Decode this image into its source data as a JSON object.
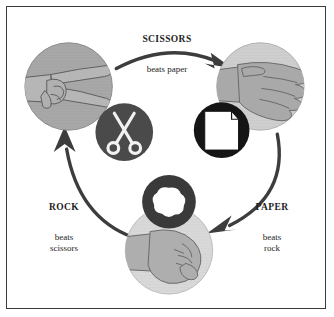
{
  "diagram": {
    "labels": {
      "scissors": {
        "title": "SCISSORS",
        "sub": "beats paper"
      },
      "rock": {
        "title": "ROCK",
        "sub": "beats\nscissors"
      },
      "paper": {
        "title": "PAPER",
        "sub": "beats\nrock"
      }
    },
    "nodes": [
      {
        "id": "scissors-hand",
        "name": "scissors-hand-circle",
        "gesture": "two fingers extended sideways",
        "fill": "#a8a8a8"
      },
      {
        "id": "paper-hand",
        "name": "paper-hand-circle",
        "gesture": "flat open hand",
        "fill": "#cfcfcf"
      },
      {
        "id": "rock-hand",
        "name": "rock-hand-circle",
        "gesture": "closed fist",
        "fill": "#d9d9d9"
      }
    ],
    "icons": [
      {
        "id": "scissors-icon",
        "name": "scissors-icon",
        "circle_fill": "#4a4a4a",
        "glyph_fill": "#f2f2f2"
      },
      {
        "id": "paper-icon",
        "name": "paper-sheet-icon",
        "circle_fill": "#151515",
        "glyph_fill": "#ffffff"
      },
      {
        "id": "rock-icon",
        "name": "rock-ring-icon",
        "ring_fill": "#3a3a3a",
        "center_fill": "#ffffff"
      }
    ],
    "arrows": [
      {
        "id": "arrow-scissors-to-paper",
        "name": "arrow-scissors-to-paper",
        "from": "scissors",
        "to": "paper"
      },
      {
        "id": "arrow-paper-to-rock",
        "name": "arrow-paper-to-rock",
        "from": "paper",
        "to": "rock"
      },
      {
        "id": "arrow-rock-to-scissors",
        "name": "arrow-rock-to-scissors",
        "from": "rock",
        "to": "scissors"
      }
    ],
    "colors": {
      "border": "#3a3a3a",
      "background": "#ffffff",
      "arrow": "#3d3d3d",
      "text": "#1d1d1d"
    }
  }
}
